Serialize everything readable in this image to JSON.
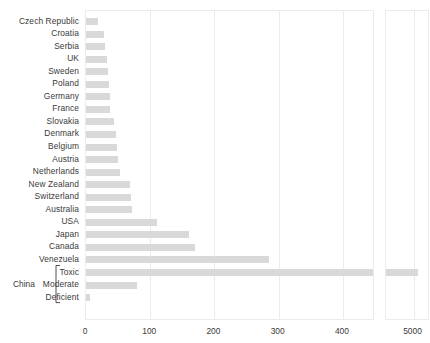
{
  "chart_data": {
    "type": "bar",
    "orientation": "horizontal",
    "title": "",
    "xlabel": "",
    "ylabel": "",
    "grid": true,
    "legend": null,
    "broken_axis": true,
    "axis_note": "x-axis is broken: left panel spans 0-450, right panel shows the 5000 region",
    "panels": [
      {
        "name": "left-panel",
        "xlim": [
          0,
          450
        ],
        "ticks": [
          0,
          100,
          200,
          300,
          400
        ]
      },
      {
        "name": "right-panel",
        "xlim": [
          4900,
          5060
        ],
        "ticks": [
          5000
        ]
      }
    ],
    "tick_labels": [
      "0",
      "100",
      "200",
      "300",
      "400",
      "5000"
    ],
    "group_label": "China",
    "group_members": [
      "Toxic",
      "Moderate",
      "Deficient"
    ],
    "categories": [
      "Czech Republic",
      "Croatia",
      "Serbia",
      "UK",
      "Sweden",
      "Poland",
      "Germany",
      "France",
      "Slovakia",
      "Denmark",
      "Belgium",
      "Austria",
      "Netherlands",
      "New Zealand",
      "Switzerland",
      "Australia",
      "USA",
      "Japan",
      "Canada",
      "Venezuela",
      "Toxic",
      "Moderate",
      "Deficient"
    ],
    "values": [
      18,
      28,
      30,
      33,
      35,
      36,
      38,
      38,
      44,
      47,
      48,
      50,
      53,
      68,
      70,
      72,
      110,
      160,
      170,
      285,
      5015,
      80,
      7
    ],
    "colors": {
      "bar": "#d9d9d9",
      "grid": "#ebebeb",
      "frame": "#ebebeb",
      "text": "#3a3a3a",
      "background": "#ffffff"
    }
  }
}
